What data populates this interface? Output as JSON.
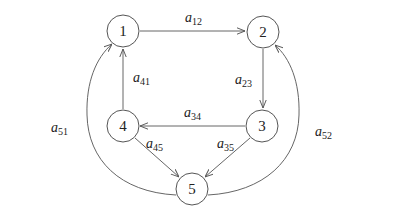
{
  "diagram": {
    "type": "directed-graph",
    "style": {
      "stroke": "#666666",
      "node_fill": "#ffffff",
      "text": "#222222"
    },
    "nodes": [
      {
        "id": "1",
        "label": "1",
        "x": 123,
        "y": 31
      },
      {
        "id": "2",
        "label": "2",
        "x": 263,
        "y": 32
      },
      {
        "id": "3",
        "label": "3",
        "x": 262,
        "y": 126
      },
      {
        "id": "4",
        "label": "4",
        "x": 123,
        "y": 126
      },
      {
        "id": "5",
        "label": "5",
        "x": 192,
        "y": 189
      }
    ],
    "edges": [
      {
        "from": "1",
        "to": "2",
        "label": "a",
        "sub": "12"
      },
      {
        "from": "2",
        "to": "3",
        "label": "a",
        "sub": "23"
      },
      {
        "from": "3",
        "to": "4",
        "label": "a",
        "sub": "34"
      },
      {
        "from": "3",
        "to": "5",
        "label": "a",
        "sub": "35"
      },
      {
        "from": "4",
        "to": "1",
        "label": "a",
        "sub": "41"
      },
      {
        "from": "4",
        "to": "5",
        "label": "a",
        "sub": "45"
      },
      {
        "from": "5",
        "to": "1",
        "label": "a",
        "sub": "51"
      },
      {
        "from": "5",
        "to": "2",
        "label": "a",
        "sub": "52"
      }
    ]
  }
}
